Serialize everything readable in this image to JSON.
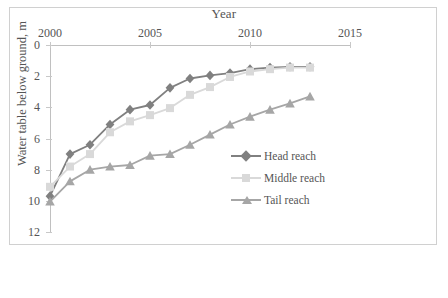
{
  "chart_data": {
    "type": "line",
    "title": "Year",
    "xlabel": "Year",
    "ylabel": "Water table below ground, m",
    "xlim": [
      2000,
      2015
    ],
    "ylim": [
      0,
      12
    ],
    "y_axis_inverted": true,
    "grid": false,
    "legend_position": "center-right",
    "x_ticks": [
      2000,
      2005,
      2010,
      2015
    ],
    "x_tick_labels": [
      "2000",
      "2005",
      "2010",
      "2015"
    ],
    "y_ticks": [
      0,
      2,
      4,
      6,
      8,
      10,
      12
    ],
    "y_tick_labels": [
      "0",
      "2",
      "4",
      "6",
      "8",
      "10",
      "12"
    ],
    "x": [
      2000,
      2001,
      2002,
      2003,
      2004,
      2005,
      2006,
      2007,
      2008,
      2009,
      2010,
      2011,
      2012,
      2013
    ],
    "series": [
      {
        "name": "Head reach",
        "color": "#808080",
        "marker": "diamond",
        "values": [
          9.7,
          7.0,
          6.4,
          5.1,
          4.15,
          3.85,
          2.75,
          2.15,
          1.95,
          1.8,
          1.55,
          1.45,
          1.4,
          1.4
        ]
      },
      {
        "name": "Middle reach",
        "color": "#d9d9d9",
        "marker": "square",
        "values": [
          9.1,
          7.8,
          7.0,
          5.6,
          4.9,
          4.5,
          4.05,
          3.2,
          2.7,
          2.05,
          1.7,
          1.55,
          1.45,
          1.45
        ]
      },
      {
        "name": "Tail reach",
        "color": "#a6a6a6",
        "marker": "triangle",
        "values": [
          10.05,
          8.75,
          8.0,
          7.8,
          7.7,
          7.1,
          7.0,
          6.4,
          5.75,
          5.1,
          4.6,
          4.15,
          3.75,
          3.3
        ]
      }
    ]
  },
  "legend": {
    "items": [
      {
        "label": "Head reach"
      },
      {
        "label": "Middle reach"
      },
      {
        "label": "Tail reach"
      }
    ]
  }
}
